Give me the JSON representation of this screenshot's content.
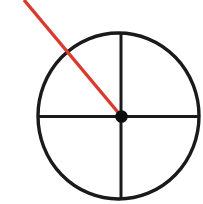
{
  "canvas": {
    "width": 203,
    "height": 204,
    "background": "#ffffff"
  },
  "colors": {
    "outline": "#1a1a1a",
    "crosshair": "#1a1a1a",
    "dot": "#0e0e0e",
    "pointer": "#d83a2e"
  },
  "figure": {
    "circle": {
      "cx": 118.5,
      "cy": 116,
      "rx": 80.5,
      "ry": 83,
      "stroke_width": 3.4
    },
    "horizontal_line": {
      "x1": 38,
      "y1": 116.5,
      "x2": 199,
      "y2": 116.5,
      "stroke_width": 3
    },
    "vertical_line": {
      "x1": 121,
      "y1": 33.5,
      "x2": 121,
      "y2": 199,
      "stroke_width": 3
    },
    "pointer_line": {
      "x1": 24,
      "y1": 0,
      "x2": 121.5,
      "y2": 116.5,
      "stroke_width": 3.4
    },
    "center_dot": {
      "cx": 121.5,
      "cy": 116.5,
      "r": 6.3
    }
  }
}
